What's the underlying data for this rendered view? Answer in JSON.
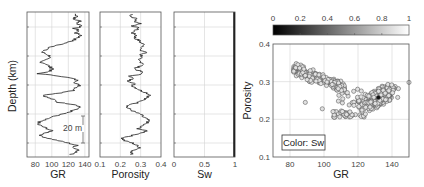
{
  "chart_data": [
    {
      "type": "line",
      "title": "",
      "xlabel": "GR",
      "ylabel": "Depth (km)",
      "xlim": [
        70,
        145
      ],
      "xticks": [
        "80",
        "100",
        "120",
        "140"
      ],
      "xtick_values": [
        80,
        100,
        120,
        140
      ],
      "grid": true,
      "annotation": "20 m",
      "depth_samples": 60,
      "values": [
        128,
        132,
        125,
        135,
        130,
        138,
        127,
        133,
        129,
        136,
        131,
        126,
        118,
        108,
        98,
        92,
        88,
        95,
        99,
        91,
        86,
        94,
        97,
        102,
        96,
        84,
        110,
        125,
        132,
        128,
        135,
        129,
        126,
        112,
        90,
        95,
        103,
        108,
        130,
        135,
        128,
        121,
        110,
        100,
        92,
        86,
        82,
        88,
        95,
        100,
        91,
        86,
        96,
        108,
        120,
        130,
        126,
        134,
        128,
        122
      ],
      "color": "#222222"
    },
    {
      "type": "line",
      "xlabel": "Porosity",
      "xlim": [
        0.1,
        0.4
      ],
      "xticks": [
        "0.1",
        "0.2",
        "0.3",
        "0.4"
      ],
      "xtick_values": [
        0.1,
        0.2,
        0.3,
        0.4
      ],
      "grid": true,
      "depth_samples": 60,
      "values": [
        0.26,
        0.25,
        0.28,
        0.27,
        0.3,
        0.26,
        0.29,
        0.27,
        0.26,
        0.28,
        0.27,
        0.29,
        0.3,
        0.32,
        0.31,
        0.29,
        0.33,
        0.3,
        0.31,
        0.28,
        0.3,
        0.32,
        0.29,
        0.27,
        0.3,
        0.31,
        0.25,
        0.26,
        0.24,
        0.27,
        0.26,
        0.28,
        0.3,
        0.33,
        0.35,
        0.33,
        0.31,
        0.29,
        0.25,
        0.23,
        0.25,
        0.27,
        0.3,
        0.31,
        0.33,
        0.34,
        0.32,
        0.3,
        0.29,
        0.33,
        0.3,
        0.25,
        0.21,
        0.22,
        0.26,
        0.28,
        0.3,
        0.27,
        0.25,
        0.26
      ],
      "color": "#222222"
    },
    {
      "type": "line",
      "xlabel": "Sw",
      "xlim": [
        0,
        1
      ],
      "xticks": [
        "0",
        "0.5",
        "1"
      ],
      "xtick_values": [
        0,
        0.5,
        1
      ],
      "grid": true,
      "values": [
        1,
        1
      ],
      "color": "#000000"
    },
    {
      "type": "scatter",
      "title": "",
      "xlabel": "GR",
      "ylabel": "Porosity",
      "xlim": [
        70,
        150
      ],
      "ylim": [
        0.1,
        0.4
      ],
      "xticks": [
        "80",
        "100",
        "120",
        "140"
      ],
      "xtick_values": [
        80,
        100,
        120,
        140
      ],
      "yticks": [
        "0.1",
        "0.2",
        "0.3",
        "0.4"
      ],
      "ytick_values": [
        0.1,
        0.2,
        0.3,
        0.4
      ],
      "grid": true,
      "legend_box": "Color: Sw",
      "colorbar": {
        "label": "Sw",
        "range": [
          0,
          1
        ],
        "ticks": [
          "0",
          "0.2",
          "0.4",
          "0.6",
          "0.8",
          "1"
        ],
        "tick_values": [
          0,
          0.2,
          0.4,
          0.6,
          0.8,
          1
        ],
        "colormap": "gray",
        "position": "top"
      },
      "clusters": [
        {
          "name": "low-GR cluster",
          "gr_range": [
            82,
            112
          ],
          "porosity_range": [
            0.27,
            0.37
          ],
          "trend": "porosity decreasing with GR",
          "count": 220
        },
        {
          "name": "high-GR cluster",
          "gr_range": [
            105,
            148
          ],
          "porosity_range": [
            0.2,
            0.32
          ],
          "center": [
            132,
            0.26
          ],
          "count": 380
        }
      ],
      "outliers": [
        [
          89,
          0.245
        ],
        [
          99,
          0.228
        ],
        [
          150,
          0.298
        ]
      ],
      "highlight_point": [
        132,
        0.258
      ],
      "marker": "open circle",
      "marker_fill": "#e0e0e0"
    }
  ]
}
